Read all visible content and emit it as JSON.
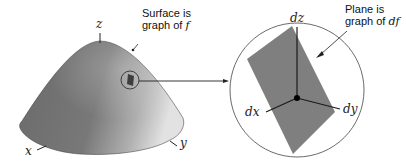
{
  "left_figure": {
    "surface_label_line1": "Surface is",
    "surface_label_line2": "graph of ",
    "surface_label_var": "f",
    "axis_z": "z",
    "axis_x": "x",
    "axis_y": "y"
  },
  "right_figure": {
    "plane_label_line1": "Plane is",
    "plane_label_line2": "graph of ",
    "plane_label_var": "df",
    "axis_dz": "dz",
    "axis_dx": "dx",
    "axis_dy": "dy"
  },
  "colors": {
    "surface_dark": "#6e6e6e",
    "surface_light": "#d8d8d8",
    "plane": "#7d7d7d",
    "line": "#222222"
  }
}
